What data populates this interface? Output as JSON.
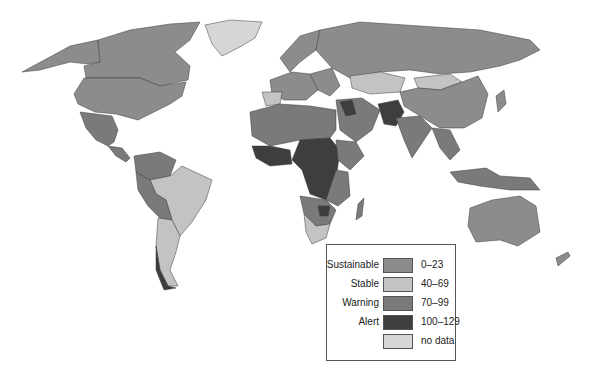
{
  "map": {
    "type": "choropleth world map",
    "palette": {
      "sustainable": "#8c8c8c",
      "stable": "#c3c3c3",
      "warning": "#7a7a7a",
      "alert": "#3e3e3e",
      "no_data": "#d6d6d6",
      "ocean": "#ffffff"
    }
  },
  "legend": {
    "items": [
      {
        "label": "Sustainable",
        "range": "0–23",
        "color": "#8c8c8c"
      },
      {
        "label": "Stable",
        "range": "40–69",
        "color": "#c3c3c3"
      },
      {
        "label": "Warning",
        "range": "70–99",
        "color": "#7a7a7a"
      },
      {
        "label": "Alert",
        "range": "100–129",
        "color": "#3e3e3e"
      },
      {
        "label": "",
        "range": "no data",
        "color": "#d6d6d6"
      }
    ]
  }
}
